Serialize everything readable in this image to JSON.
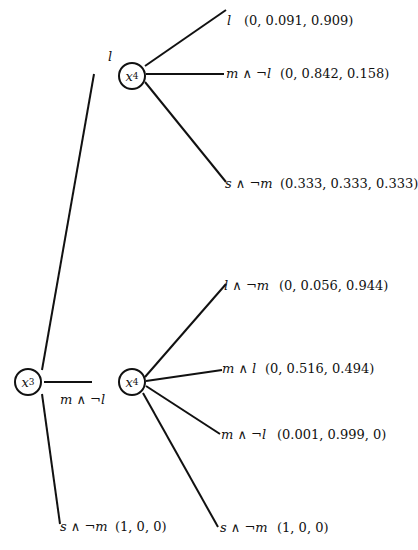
{
  "root": {
    "name": "x",
    "sub": "3"
  },
  "subtrees": [
    {
      "edge_label": "l",
      "node": {
        "name": "x",
        "sub": "4"
      },
      "leaves": [
        {
          "label": "l",
          "value": "(0, 0.091, 0.909)"
        },
        {
          "label": "m ∧ ¬l",
          "value": "(0, 0.842, 0.158)"
        },
        {
          "label": "s ∧ ¬m",
          "value": "(0.333, 0.333, 0.333)"
        }
      ]
    },
    {
      "edge_label": "m ∧ ¬l",
      "node": {
        "name": "x",
        "sub": "4"
      },
      "leaves": [
        {
          "label": "l ∧ ¬m",
          "value": "(0, 0.056, 0.944)"
        },
        {
          "label": "m ∧ l",
          "value": "(0, 0.516, 0.494)"
        },
        {
          "label": "m ∧ ¬l",
          "value": "(0.001, 0.999, 0)"
        },
        {
          "label": "s ∧ ¬m",
          "value": "(1, 0, 0)"
        }
      ]
    }
  ],
  "root_leaf": {
    "label": "s ∧ ¬m",
    "value": "(1, 0, 0)"
  }
}
